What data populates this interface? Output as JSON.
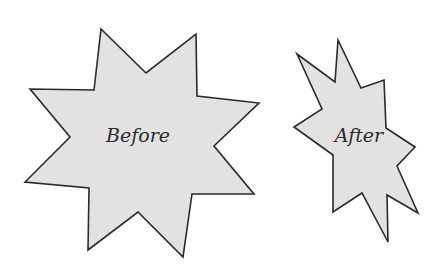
{
  "diagram": {
    "shapes": [
      {
        "id": "before",
        "label": "Before",
        "shape": "eight-point-star",
        "points": "101,29 146,73 196,34 197,96 259,103 214,146 254,194 192,194 183,257 138,212 88,250 89,188 25,182 70,137 30,89 94,90",
        "label_x": 138,
        "label_y": 142
      },
      {
        "id": "after",
        "label": "After",
        "shape": "distorted-eight-point-star",
        "points": "297,54 335,82 338,40 361,88 384,80 386,128 415,147 397,166 418,213 387,195 388,242 362,193 333,212 333,155 294,127 322,109",
        "label_x": 359,
        "label_y": 142
      }
    ],
    "colors": {
      "fill": "#e2e2e2",
      "stroke": "#2a2a2a",
      "text": "#2b2b2b",
      "background": "#ffffff"
    }
  }
}
